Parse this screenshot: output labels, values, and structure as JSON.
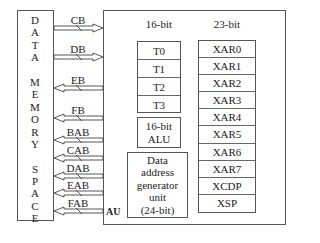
{
  "memory": {
    "label_letters": [
      "D",
      "A",
      "T",
      "A",
      "",
      "M",
      "E",
      "M",
      "O",
      "R",
      "Y",
      "",
      "S",
      "P",
      "A",
      "C",
      "E"
    ]
  },
  "buses": [
    {
      "name": "CB",
      "direction": "to-cpu"
    },
    {
      "name": "DB",
      "direction": "to-cpu"
    },
    {
      "name": "EB",
      "direction": "to-memory"
    },
    {
      "name": "FB",
      "direction": "to-memory"
    },
    {
      "name": "BAB",
      "direction": "to-memory"
    },
    {
      "name": "CAB",
      "direction": "to-memory"
    },
    {
      "name": "DAB",
      "direction": "to-memory"
    },
    {
      "name": "EAB",
      "direction": "to-memory"
    },
    {
      "name": "FAB",
      "direction": "to-memory"
    }
  ],
  "au": {
    "label": "AU",
    "t_header": "16-bit",
    "xar_header": "23-bit",
    "t_registers": [
      "T0",
      "T1",
      "T2",
      "T3"
    ],
    "alu_line1": "16-bit",
    "alu_line2": "ALU",
    "dagu_lines": [
      "Data",
      "address",
      "generator",
      "unit",
      "(24-bit)"
    ],
    "xar_registers": [
      "XAR0",
      "XAR1",
      "XAR2",
      "XAR3",
      "XAR4",
      "XAR5",
      "XAR6",
      "XAR7",
      "XCDP",
      "XSP"
    ]
  }
}
